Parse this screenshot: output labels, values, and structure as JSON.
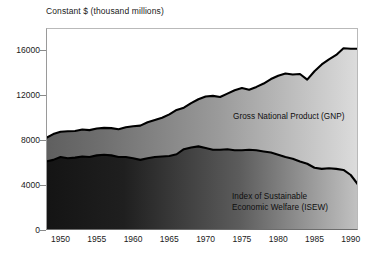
{
  "axis_title": "Constant $ (thousand millions)",
  "labels": {
    "gnp": "Gross National Product (GNP)",
    "isew": "Index of Sustainable\nEconomic Welfare (ISEW)"
  },
  "colors": {
    "outline": "#000000",
    "gnp_band_dark": "#6e6e6e",
    "gnp_band_light": "#d8d8d8",
    "isew_band_dark": "#1b1b1b",
    "isew_band_light": "#b9b9b9",
    "text": "#1a1a1a",
    "frame": "#8a8a8a",
    "background": "#ffffff"
  },
  "chart_data": {
    "type": "area",
    "title": "Constant $ (thousand millions)",
    "xlabel": "",
    "ylabel": "Constant $ (thousand millions)",
    "xlim": [
      1948,
      1991
    ],
    "ylim": [
      0,
      18000
    ],
    "grid": false,
    "legend_position": "inline-annotations",
    "ytick_values": [
      0,
      4000,
      8000,
      12000,
      16000
    ],
    "ytick_labels": [
      "0",
      "4000",
      "8000",
      "12000",
      "16000"
    ],
    "xtick_values": [
      1950,
      1955,
      1960,
      1965,
      1970,
      1975,
      1980,
      1985,
      1990
    ],
    "xtick_labels": [
      "1950",
      "1955",
      "1960",
      "1965",
      "1970",
      "1975",
      "1980",
      "1985",
      "1990"
    ],
    "x": [
      1948,
      1949,
      1950,
      1951,
      1952,
      1953,
      1954,
      1955,
      1956,
      1957,
      1958,
      1959,
      1960,
      1961,
      1962,
      1963,
      1964,
      1965,
      1966,
      1967,
      1968,
      1969,
      1970,
      1971,
      1972,
      1973,
      1974,
      1975,
      1976,
      1977,
      1978,
      1979,
      1980,
      1981,
      1982,
      1983,
      1984,
      1985,
      1986,
      1987,
      1988,
      1989,
      1990,
      1991
    ],
    "series": [
      {
        "name": "Gross National Product (GNP)",
        "values": [
          8200,
          8550,
          8750,
          8800,
          8820,
          8950,
          8900,
          9050,
          9100,
          9080,
          8980,
          9150,
          9250,
          9300,
          9600,
          9800,
          10000,
          10300,
          10700,
          10900,
          11300,
          11650,
          11900,
          11950,
          11850,
          12150,
          12450,
          12650,
          12500,
          12750,
          13050,
          13450,
          13750,
          13950,
          13850,
          13900,
          13400,
          14150,
          14750,
          15200,
          15600,
          16200,
          16150,
          16150
        ]
      },
      {
        "name": "Index of Sustainable Economic Welfare (ISEW)",
        "values": [
          6100,
          6250,
          6500,
          6400,
          6450,
          6550,
          6500,
          6650,
          6700,
          6650,
          6500,
          6500,
          6400,
          6250,
          6400,
          6500,
          6550,
          6600,
          6750,
          7200,
          7350,
          7450,
          7300,
          7150,
          7150,
          7200,
          7100,
          7100,
          7150,
          7100,
          7000,
          6900,
          6700,
          6500,
          6350,
          6100,
          5900,
          5550,
          5450,
          5500,
          5450,
          5350,
          4900,
          4050
        ]
      }
    ]
  }
}
